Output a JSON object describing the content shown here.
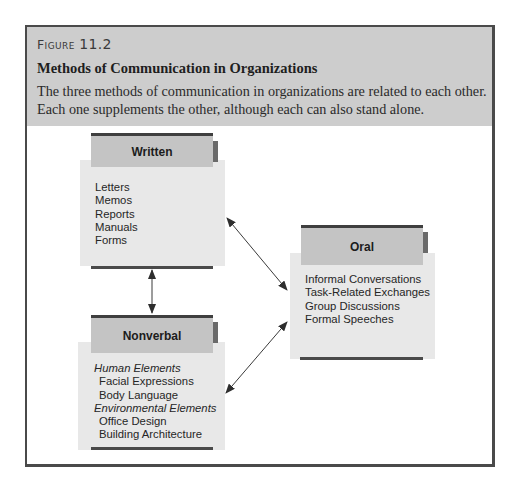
{
  "figure": {
    "label_prefix": "Figure",
    "label_number": "11.2",
    "title": "Methods of Communication in Organizations",
    "description": "The three methods of communication in organizations are related to each other. Each one supplements the other, although each can also stand alone."
  },
  "diagram": {
    "nodes": {
      "written": {
        "title": "Written",
        "items": [
          "Letters",
          "Memos",
          "Reports",
          "Manuals",
          "Forms"
        ]
      },
      "nonverbal": {
        "title": "Nonverbal",
        "groups": [
          {
            "label": "Human Elements",
            "items": [
              "Facial Expressions",
              "Body Language"
            ]
          },
          {
            "label": "Environmental Elements",
            "items": [
              "Office Design",
              "Building Architecture"
            ]
          }
        ]
      },
      "oral": {
        "title": "Oral",
        "items": [
          "Informal Conversations",
          "Task-Related Exchanges",
          "Group Discussions",
          "Formal Speeches"
        ]
      }
    },
    "edges": [
      {
        "from": "Written",
        "to": "Nonverbal",
        "type": "bidirectional"
      },
      {
        "from": "Written",
        "to": "Oral",
        "type": "bidirectional"
      },
      {
        "from": "Nonverbal",
        "to": "Oral",
        "type": "bidirectional"
      }
    ],
    "colors": {
      "caption_band": "#cdcdcd",
      "header_fill": "#c4c4c4",
      "panel_fill": "#e8e8e8",
      "rule": "#3f3f3f",
      "arrow": "#3a3a3a"
    }
  }
}
